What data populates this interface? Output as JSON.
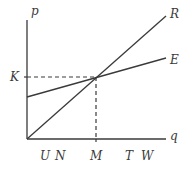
{
  "diagram": {
    "axes": {
      "y_label": "p",
      "x_label": "q"
    },
    "curves": [
      {
        "name": "R",
        "label": "R"
      },
      {
        "name": "E",
        "label": "E"
      }
    ],
    "y_marks": [
      {
        "label": "K"
      }
    ],
    "x_marks": [
      {
        "label": "U"
      },
      {
        "label": "N"
      },
      {
        "label": "M"
      },
      {
        "label": "T"
      },
      {
        "label": "W"
      }
    ],
    "colors": {
      "line": "#3a3a3a",
      "background": "#ffffff"
    }
  }
}
